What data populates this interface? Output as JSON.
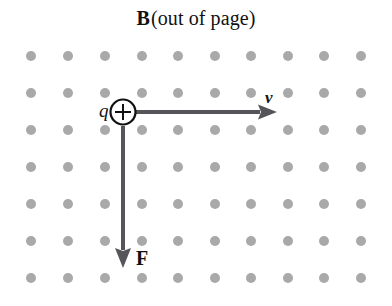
{
  "figure": {
    "name": "magnetic-force-on-moving-positive-charge",
    "width": 392,
    "height": 306,
    "background_color": "#ffffff"
  },
  "title": {
    "symbol": "B",
    "caption": "(out of page)",
    "full_text": "B (out of page)",
    "color": "#111111",
    "x_center": 196,
    "y": 18
  },
  "field": {
    "name": "magnetic-field-out-of-page",
    "marker": "dot",
    "dot_color": "#a9a9a9",
    "dot_diameter": 10,
    "columns": 10,
    "rows": 7,
    "column_x": [
      31,
      68,
      105,
      142,
      178,
      215,
      251,
      288,
      324,
      361
    ],
    "row_y": [
      56,
      93,
      130,
      167,
      204,
      241,
      278
    ],
    "total_dots": 70
  },
  "charge": {
    "name": "positive-point-charge",
    "label": "q",
    "sign": "+",
    "cx": 123,
    "cy": 112,
    "radius": 13,
    "stroke_color": "#111111",
    "fill_color": "#ffffff",
    "label_x": 103,
    "label_y": 112
  },
  "vectors": [
    {
      "name": "velocity-vector",
      "label": "v",
      "label_style": "bold-italic",
      "direction": "right",
      "from_x": 136,
      "from_y": 112,
      "to_x": 277,
      "to_y": 112,
      "color": "#55555a",
      "shaft_width": 4,
      "head_length": 19,
      "head_width": 15,
      "label_x": 271,
      "label_y": 97
    },
    {
      "name": "force-vector",
      "label": "F",
      "label_style": "bold-upright",
      "direction": "down",
      "from_x": 123,
      "from_y": 126,
      "to_x": 123,
      "to_y": 268,
      "color": "#55555a",
      "shaft_width": 4,
      "head_length": 20,
      "head_width": 16,
      "label_x": 141,
      "label_y": 260
    }
  ],
  "colors": {
    "dot": "#a9a9a9",
    "arrow": "#55555a",
    "ink": "#111111",
    "paper": "#ffffff"
  }
}
